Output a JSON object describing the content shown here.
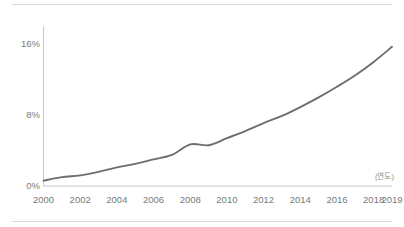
{
  "chart_data": {
    "type": "line",
    "title": "",
    "subtitle": "",
    "xlabel": "(연도)",
    "ylabel": "",
    "xlim": [
      2000,
      2019
    ],
    "ylim": [
      0,
      17.6
    ],
    "grid": false,
    "legend": null,
    "legend_position": "none",
    "line_color": "#6e6e6e",
    "axis_color": "#c8c8c8",
    "tick_label_color": "#7a7a7a",
    "y_ticks": [
      "0%",
      "8%",
      "16%"
    ],
    "y_tick_values": [
      0,
      8,
      16
    ],
    "x_ticks": [
      "2000",
      "2002",
      "2004",
      "2006",
      "2008",
      "2010",
      "2012",
      "2014",
      "2016",
      "2018",
      "2019"
    ],
    "x_tick_values": [
      2000,
      2002,
      2004,
      2006,
      2008,
      2010,
      2012,
      2014,
      2016,
      2018,
      2019
    ],
    "x": [
      2000,
      2001,
      2002,
      2003,
      2004,
      2005,
      2006,
      2007,
      2008,
      2009,
      2010,
      2011,
      2012,
      2013,
      2014,
      2015,
      2016,
      2017,
      2018,
      2019
    ],
    "values": [
      0.6,
      1.0,
      1.2,
      1.6,
      2.1,
      2.5,
      3.0,
      3.5,
      4.7,
      4.6,
      5.4,
      6.2,
      7.1,
      7.9,
      8.9,
      10.0,
      11.2,
      12.5,
      14.0,
      15.7
    ],
    "series": [
      {
        "name": "",
        "values": [
          0.6,
          1.0,
          1.2,
          1.6,
          2.1,
          2.5,
          3.0,
          3.5,
          4.7,
          4.6,
          5.4,
          6.2,
          7.1,
          7.9,
          8.9,
          10.0,
          11.2,
          12.5,
          14.0,
          15.7
        ]
      }
    ],
    "annotations": []
  },
  "axis_note": {
    "text": "(연도)"
  },
  "rules": {
    "top": "",
    "bottom": ""
  }
}
